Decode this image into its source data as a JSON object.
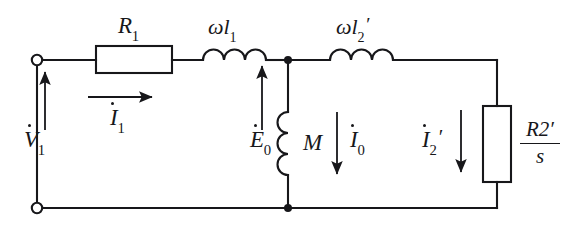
{
  "diagram": {
    "type": "electrical-schematic",
    "stroke_color": "#17171a",
    "background_color": "#ffffff",
    "labels": {
      "r1": {
        "base": "R",
        "sub": "1",
        "prime": "",
        "text": "R1"
      },
      "omega_l1": {
        "omega": "ω",
        "base": "l",
        "sub": "1",
        "prime": "",
        "text": "ωl1"
      },
      "omega_l2p": {
        "omega": "ω",
        "base": "l",
        "sub": "2",
        "prime": "′",
        "text": "ωl2′"
      },
      "v1": {
        "base": "V",
        "sub": "1",
        "prime": "",
        "text": "V̇ 1"
      },
      "i1": {
        "base": "I",
        "sub": "1",
        "prime": "",
        "text": "İ 1"
      },
      "e0": {
        "base": "E",
        "sub": "0",
        "prime": "",
        "text": "Ė 0"
      },
      "m": {
        "base": "M",
        "sub": "",
        "prime": "",
        "text": "M"
      },
      "i0": {
        "base": "I",
        "sub": "0",
        "prime": "",
        "text": "İ 0"
      },
      "i2p": {
        "base": "I",
        "sub": "2",
        "prime": "′",
        "text": "İ 2′"
      },
      "r2p_over_s": {
        "numerator_base": "R",
        "numerator_sub": "2",
        "numerator_prime": "′",
        "denominator": "s",
        "text": "R2′/s"
      }
    },
    "components": [
      {
        "name": "resistor-r1",
        "kind": "resistor",
        "orientation": "horizontal",
        "label": "R1"
      },
      {
        "name": "inductor-omega-l1",
        "kind": "inductor",
        "orientation": "horizontal",
        "coils": 3,
        "label": "ωl1"
      },
      {
        "name": "inductor-omega-l2p",
        "kind": "inductor",
        "orientation": "horizontal",
        "coils": 3,
        "label": "ωl2′"
      },
      {
        "name": "inductor-m",
        "kind": "inductor",
        "orientation": "vertical",
        "coils": 3,
        "label": "M"
      },
      {
        "name": "resistor-r2p-over-s",
        "kind": "resistor",
        "orientation": "vertical",
        "label": "R2′/s"
      }
    ],
    "terminals": [
      {
        "name": "terminal-top-left",
        "x": 37,
        "y": 60
      },
      {
        "name": "terminal-bottom-left",
        "x": 37,
        "y": 208
      }
    ],
    "nodes": [
      {
        "name": "node-top-mid",
        "x": 288,
        "y": 60
      },
      {
        "name": "node-bottom-mid",
        "x": 288,
        "y": 208
      }
    ],
    "arrows": [
      {
        "name": "arrow-v1",
        "direction": "up",
        "label": "V̇ 1"
      },
      {
        "name": "arrow-i1",
        "direction": "right",
        "label": "İ 1"
      },
      {
        "name": "arrow-e0",
        "direction": "up",
        "label": "Ė 0"
      },
      {
        "name": "arrow-i0",
        "direction": "down",
        "label": "İ 0"
      },
      {
        "name": "arrow-i2p",
        "direction": "down",
        "label": "İ 2′"
      }
    ]
  }
}
